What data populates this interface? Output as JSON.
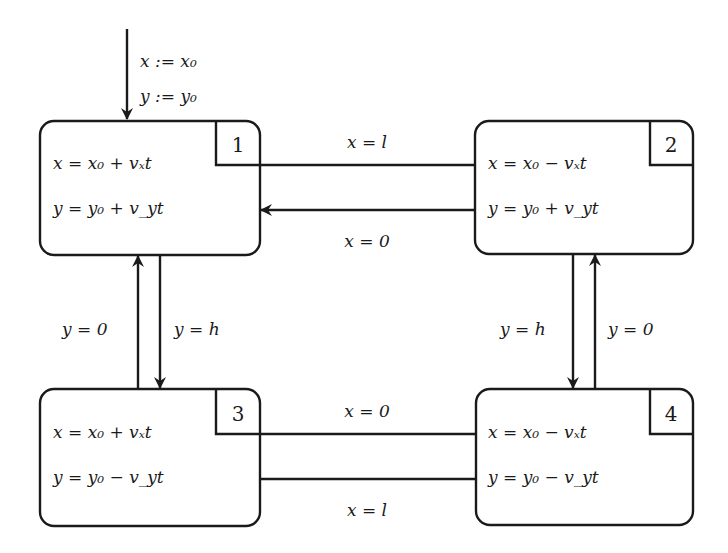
{
  "diagram": {
    "type": "hybrid-automaton",
    "initial": {
      "target_state": "1",
      "assignments": [
        "x := x₀",
        "y := y₀"
      ]
    },
    "states": [
      {
        "id": "1",
        "label": "1",
        "equations": [
          "x = x₀ + vₓt",
          "y = y₀ + v_yt"
        ]
      },
      {
        "id": "2",
        "label": "2",
        "equations": [
          "x = x₀ − vₓt",
          "y = y₀ + v_yt"
        ]
      },
      {
        "id": "3",
        "label": "3",
        "equations": [
          "x = x₀ + vₓt",
          "y = y₀ − v_yt"
        ]
      },
      {
        "id": "4",
        "label": "4",
        "equations": [
          "x = x₀ − vₓt",
          "y = y₀ − v_yt"
        ]
      }
    ],
    "transitions": [
      {
        "from": "1",
        "to": "2",
        "guard": "x = l"
      },
      {
        "from": "2",
        "to": "1",
        "guard": "x = 0"
      },
      {
        "from": "1",
        "to": "3",
        "guard": "y = h"
      },
      {
        "from": "3",
        "to": "1",
        "guard": "y = 0"
      },
      {
        "from": "2",
        "to": "4",
        "guard": "y = h"
      },
      {
        "from": "4",
        "to": "2",
        "guard": "y = 0"
      },
      {
        "from": "4",
        "to": "3",
        "guard": "x = 0"
      },
      {
        "from": "3",
        "to": "4",
        "guard": "x = l"
      }
    ]
  }
}
